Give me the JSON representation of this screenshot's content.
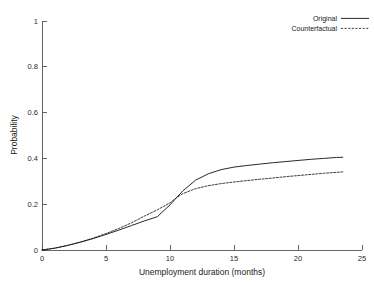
{
  "chart_data": {
    "type": "line",
    "title": "",
    "subtitle": "",
    "xlabel": "Unemployment duration (months)",
    "ylabel": "Probability",
    "xlim": [
      0,
      25
    ],
    "ylim": [
      0,
      1
    ],
    "xticks": [
      "0",
      "5",
      "10",
      "15",
      "20",
      "25"
    ],
    "xtick_values": [
      0,
      5,
      10,
      15,
      20,
      25
    ],
    "yticks": [
      "0",
      "0.2",
      "0.4",
      "0.6",
      "0.8",
      "1"
    ],
    "ytick_values": [
      0,
      0.2,
      0.4,
      0.6,
      0.8,
      1
    ],
    "grid": false,
    "legend_position": "top-right",
    "line_color": "#1c1c1c",
    "axis_color": "#555555",
    "background_color": "#ffffff",
    "series": [
      {
        "name": "Original",
        "style": "solid",
        "x": [
          0,
          1,
          2,
          3,
          4,
          5,
          6,
          7,
          8,
          9,
          10,
          10.5,
          11,
          12,
          13,
          14,
          15,
          16,
          17,
          18,
          19,
          20,
          21,
          22,
          23,
          23.5
        ],
        "values": [
          0,
          0.008,
          0.02,
          0.034,
          0.05,
          0.068,
          0.087,
          0.107,
          0.127,
          0.145,
          0.197,
          0.228,
          0.258,
          0.305,
          0.333,
          0.351,
          0.362,
          0.369,
          0.375,
          0.381,
          0.386,
          0.391,
          0.396,
          0.4,
          0.404,
          0.405
        ]
      },
      {
        "name": "Counterfactual",
        "style": "dashed",
        "x": [
          0,
          1,
          2,
          3,
          4,
          5,
          6,
          7,
          8,
          9,
          10,
          10.5,
          11,
          12,
          13,
          14,
          15,
          16,
          17,
          18,
          19,
          20,
          21,
          22,
          23,
          23.5
        ],
        "values": [
          0,
          0.008,
          0.02,
          0.035,
          0.052,
          0.072,
          0.094,
          0.119,
          0.148,
          0.175,
          0.206,
          0.228,
          0.246,
          0.268,
          0.281,
          0.29,
          0.297,
          0.303,
          0.309,
          0.314,
          0.32,
          0.325,
          0.33,
          0.335,
          0.339,
          0.341
        ]
      }
    ],
    "legend": [
      {
        "label": "Original",
        "style": "solid"
      },
      {
        "label": "Counterfactual",
        "style": "dashed"
      }
    ]
  }
}
